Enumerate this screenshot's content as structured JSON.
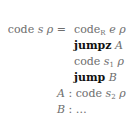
{
  "equation": {
    "lhs": {
      "fn": "code",
      "arg1": "s",
      "arg2": "ρ",
      "op": "="
    },
    "rows": [
      {
        "fn": "code",
        "sub": "R",
        "arg1": "e",
        "arg2": "ρ"
      },
      {
        "kw": "jumpz",
        "target": "A"
      },
      {
        "fn": "code",
        "arg1": "s",
        "sub": "1",
        "arg2": "ρ"
      },
      {
        "kw": "jump",
        "target": "B"
      },
      {
        "label": "A",
        "sep": ":",
        "fn": "code",
        "arg1": "s",
        "sub": "2",
        "arg2": "ρ"
      },
      {
        "label": "B",
        "sep": ":",
        "rest": "…"
      }
    ]
  }
}
